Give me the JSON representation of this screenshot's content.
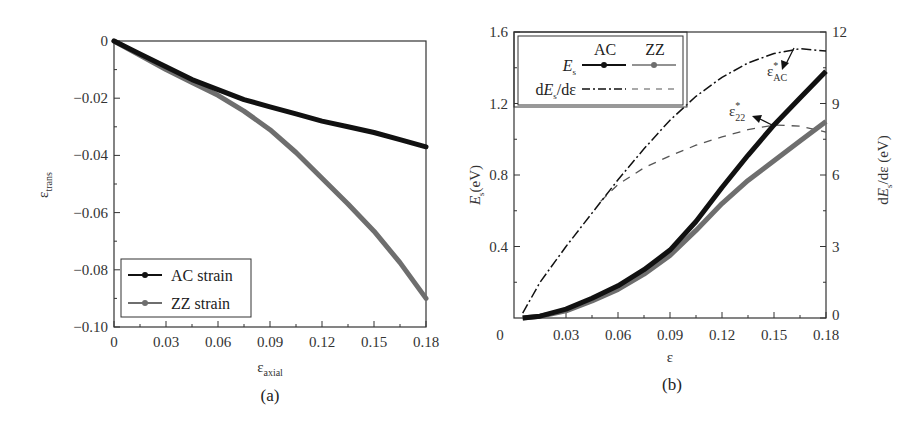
{
  "figure": {
    "panels": [
      {
        "label": "(a)"
      },
      {
        "label": "(b)"
      }
    ]
  },
  "colors": {
    "ac": "#111111",
    "zz": "#6e6e6e",
    "axis": "#333333",
    "background": "#ffffff"
  },
  "chart_data": [
    {
      "type": "line",
      "panel": "(a)",
      "title": "",
      "xlabel": "ε",
      "xlabel_sub": "axial",
      "ylabel": "ε",
      "ylabel_sub": "trans",
      "xlim": [
        0,
        0.18
      ],
      "ylim": [
        -0.1,
        0
      ],
      "grid": false,
      "legend_position": "lower left",
      "x_ticks": [
        "0",
        "0.03",
        "0.06",
        "0.09",
        "0.12",
        "0.15",
        "0.18"
      ],
      "y_ticks": [
        "0",
        "−0.02",
        "−0.04",
        "−0.06",
        "−0.08",
        "−0.10"
      ],
      "x": [
        0,
        0.015,
        0.03,
        0.045,
        0.06,
        0.075,
        0.09,
        0.105,
        0.12,
        0.135,
        0.15,
        0.165,
        0.18
      ],
      "series": [
        {
          "name": "AC strain",
          "color": "#111111",
          "values": [
            0,
            -0.0045,
            -0.009,
            -0.0135,
            -0.017,
            -0.0205,
            -0.023,
            -0.0255,
            -0.028,
            -0.03,
            -0.032,
            -0.0345,
            -0.037
          ]
        },
        {
          "name": "ZZ strain",
          "color": "#6e6e6e",
          "values": [
            0,
            -0.005,
            -0.01,
            -0.0145,
            -0.019,
            -0.0245,
            -0.031,
            -0.039,
            -0.048,
            -0.057,
            -0.0665,
            -0.0775,
            -0.09
          ]
        }
      ]
    },
    {
      "type": "line",
      "panel": "(b)",
      "title": "",
      "xlabel": "ε",
      "ylabel": "E_s(eV)",
      "ylabel_right": "dE_s/dε (eV)",
      "xlim": [
        0,
        0.18
      ],
      "ylim": [
        0,
        1.6
      ],
      "ylim_right": [
        0,
        12
      ],
      "grid": false,
      "legend_position": "upper left",
      "legend_columns": [
        "AC",
        "ZZ"
      ],
      "legend_rows": [
        "E_s",
        "dE_s/dε"
      ],
      "x_ticks": [
        "0",
        "0.03",
        "0.06",
        "0.09",
        "0.12",
        "0.15",
        "0.18"
      ],
      "y_ticks": [
        "0.4",
        "0.8",
        "1.2",
        "1.6"
      ],
      "y_ticks_bottom_label": "0",
      "y_ticks_right": [
        "0",
        "3",
        "6",
        "9",
        "12"
      ],
      "x": [
        0.005,
        0.015,
        0.03,
        0.045,
        0.06,
        0.075,
        0.09,
        0.105,
        0.12,
        0.135,
        0.15,
        0.165,
        0.18
      ],
      "series": [
        {
          "name": "E_s AC",
          "axis": "left",
          "style": "solid",
          "color": "#111111",
          "values": [
            0,
            0.01,
            0.05,
            0.11,
            0.18,
            0.27,
            0.38,
            0.54,
            0.73,
            0.91,
            1.08,
            1.23,
            1.38
          ]
        },
        {
          "name": "E_s ZZ",
          "axis": "left",
          "style": "solid",
          "color": "#6e6e6e",
          "values": [
            0,
            0.01,
            0.04,
            0.095,
            0.16,
            0.245,
            0.35,
            0.49,
            0.64,
            0.77,
            0.88,
            0.99,
            1.1
          ]
        },
        {
          "name": "dE_s/dε AC",
          "axis": "right",
          "style": "dash-dot",
          "color": "#111111",
          "values": [
            0.2,
            1.5,
            3.0,
            4.4,
            5.8,
            7.1,
            8.3,
            9.3,
            10.1,
            10.7,
            11.1,
            11.3,
            11.2
          ]
        },
        {
          "name": "dE_s/dε ZZ",
          "axis": "right",
          "style": "dashed",
          "color": "#555555",
          "x_override": [
            0.05,
            0.06,
            0.075,
            0.09,
            0.105,
            0.12,
            0.135,
            0.15,
            0.165,
            0.18
          ],
          "values": [
            4.9,
            5.6,
            6.3,
            6.8,
            7.25,
            7.6,
            7.9,
            8.1,
            8.05,
            7.8
          ]
        }
      ],
      "annotations": [
        {
          "text": "ε*",
          "sub": "AC",
          "target_x": 0.165,
          "target_y_right": 11.3,
          "arrow": true
        },
        {
          "text": "ε*",
          "sub": "ZZ",
          "displayed_sub": "22",
          "target_x": 0.15,
          "target_y_right": 8.1,
          "arrow": true
        }
      ]
    }
  ],
  "labels": {
    "a": {
      "ylabel_main": "ε",
      "ylabel_sub": "trans",
      "xlabel_main": "ε",
      "xlabel_sub": "axial",
      "legend": [
        "AC strain",
        "ZZ strain"
      ],
      "panel": "(a)"
    },
    "b": {
      "ylabel_E": "E",
      "ylabel_s": "s",
      "ylabel_unit": "(eV)",
      "ylabel_right_d": "d",
      "ylabel_right_E": "E",
      "ylabel_right_s": "s",
      "ylabel_right_rest": "/dε (eV)",
      "xlabel": "ε",
      "legend_col_ac": "AC",
      "legend_col_zz": "ZZ",
      "legend_row_es_E": "E",
      "legend_row_es_s": "s",
      "legend_row_d_prefix": "d",
      "legend_row_d_E": "E",
      "legend_row_d_s": "s",
      "legend_row_d_suffix": "/dε",
      "annot_ac_main": "ε",
      "annot_ac_star": "*",
      "annot_ac_sub": "AC",
      "annot_zz_main": "ε",
      "annot_zz_star": "*",
      "annot_zz_sub": "22",
      "panel": "(b)"
    }
  }
}
